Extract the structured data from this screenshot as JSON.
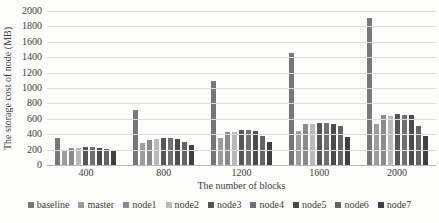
{
  "figure": {
    "background": "#fdfdfb",
    "gridline_color": "#dcdcda",
    "axis_line_color": "#b9b9b9",
    "text_color": "#3b3b3b"
  },
  "chart_data": {
    "type": "bar",
    "title": "",
    "xlabel": "The number of blocks",
    "ylabel": "The storage cost of node (MB)",
    "ylim": [
      0,
      2000
    ],
    "yticks": [
      0,
      200,
      400,
      600,
      800,
      1000,
      1200,
      1400,
      1600,
      1800,
      2000
    ],
    "grid": "horizontal",
    "legend_position": "bottom",
    "categories": [
      "400",
      "800",
      "1200",
      "1600",
      "2000"
    ],
    "series": [
      {
        "name": "baseline",
        "color": "#777777",
        "values": [
          345,
          720,
          1090,
          1455,
          1910
        ]
      },
      {
        "name": "master",
        "color": "#9d9d9d",
        "values": [
          200,
          290,
          348,
          445,
          528
        ]
      },
      {
        "name": "node1",
        "color": "#8b8b8b",
        "values": [
          218,
          330,
          425,
          538,
          650
        ]
      },
      {
        "name": "node2",
        "color": "#b9b9b9",
        "values": [
          226,
          342,
          435,
          528,
          638
        ]
      },
      {
        "name": "node3",
        "color": "#565656",
        "values": [
          240,
          356,
          456,
          552,
          660
        ]
      },
      {
        "name": "node4",
        "color": "#6f6f6f",
        "values": [
          234,
          350,
          452,
          548,
          656
        ]
      },
      {
        "name": "node5",
        "color": "#4c4c4c",
        "values": [
          220,
          332,
          436,
          536,
          645
        ]
      },
      {
        "name": "node6",
        "color": "#646464",
        "values": [
          205,
          302,
          380,
          508,
          508
        ]
      },
      {
        "name": "node7",
        "color": "#404040",
        "values": [
          190,
          265,
          295,
          370,
          380
        ]
      }
    ]
  }
}
